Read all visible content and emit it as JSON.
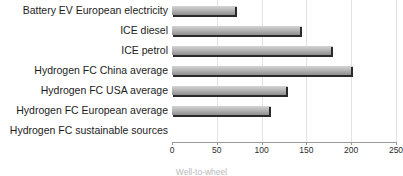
{
  "chart_data": {
    "type": "bar",
    "orientation": "horizontal",
    "title": "",
    "xlabel": "Well-to-wheel",
    "ylabel": "",
    "xlim": [
      0,
      250
    ],
    "xticks": [
      0,
      50,
      100,
      150,
      200,
      250
    ],
    "grid": true,
    "legend": false,
    "categories": [
      "Battery EV European electricity",
      "ICE diesel",
      "ICE petrol",
      "Hydrogen FC China average",
      "Hydrogen FC USA average",
      "Hydrogen FC European average",
      "Hydrogen FC sustainable sources"
    ],
    "values": [
      72,
      145,
      180,
      202,
      130,
      110,
      0
    ],
    "bar_color": "#b4b4b4"
  }
}
